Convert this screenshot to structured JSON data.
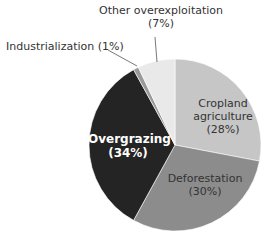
{
  "chart_data": {
    "type": "pie",
    "title": "",
    "start_angle_deg": 0,
    "direction": "clockwise",
    "slices": [
      {
        "label": "Cropland agriculture",
        "value": 28,
        "display": "(28%)",
        "color": "#c6c6c6"
      },
      {
        "label": "Deforestation",
        "value": 30,
        "display": "(30%)",
        "color": "#8c8c8c"
      },
      {
        "label": "Overgrazing",
        "value": 34,
        "display": "(34%)",
        "color": "#242424"
      },
      {
        "label": "Industrialization",
        "value": 1,
        "display": "(1%)",
        "color": "#9a9a9a"
      },
      {
        "label": "Other overexploitation",
        "value": 7,
        "display": "(7%)",
        "color": "#e9e9e9"
      }
    ],
    "legend": "none; labels placed on/near slices"
  },
  "labels": {
    "cropland_line1": "Cropland",
    "cropland_line2": "agriculture",
    "cropland_pct": "(28%)",
    "deforestation_line1": "Deforestation",
    "deforestation_pct": "(30%)",
    "overgrazing_line1": "Overgrazing",
    "overgrazing_pct": "(34%)",
    "industrialization": "Industrialization (1%)",
    "other_line1": "Other overexploitation",
    "other_pct": "(7%)"
  }
}
